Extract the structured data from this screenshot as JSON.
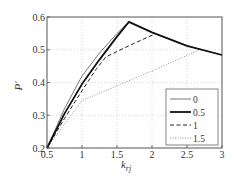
{
  "chart_data": {
    "type": "line",
    "title": "",
    "xlabel": "k_rj",
    "xlabel_main": "k",
    "xlabel_sub": "rj",
    "ylabel": "P′",
    "xlim": [
      0.5,
      3
    ],
    "ylim": [
      0.2,
      0.6
    ],
    "xticks": [
      0.5,
      1,
      1.5,
      2,
      2.5,
      3
    ],
    "xtick_labels": [
      "0.5",
      "1",
      "1.5",
      "2",
      "2.5",
      "3"
    ],
    "yticks": [
      0.2,
      0.3,
      0.4,
      0.5,
      0.6
    ],
    "ytick_labels": [
      "0.2",
      "0.3",
      "0.4",
      "0.5",
      "0.6"
    ],
    "grid": true,
    "legend_position": "lower right",
    "series": [
      {
        "name": "0",
        "style": "solid-thin",
        "color": "#555555",
        "x": [
          0.5,
          0.75,
          1.0,
          1.25,
          1.5,
          1.67,
          2.0,
          2.5,
          3.0
        ],
        "y": [
          0.2,
          0.32,
          0.42,
          0.49,
          0.55,
          0.585,
          0.553,
          0.512,
          0.484
        ]
      },
      {
        "name": "0.5",
        "style": "solid-thick",
        "color": "#111111",
        "x": [
          0.5,
          0.75,
          1.0,
          1.25,
          1.5,
          1.67,
          2.0,
          2.5,
          3.0
        ],
        "y": [
          0.2,
          0.305,
          0.395,
          0.47,
          0.54,
          0.585,
          0.553,
          0.512,
          0.484
        ]
      },
      {
        "name": "1",
        "style": "dashed",
        "color": "#222222",
        "x": [
          0.5,
          0.75,
          1.0,
          1.2,
          1.34,
          1.6,
          1.8,
          2.04
        ],
        "y": [
          0.2,
          0.29,
          0.375,
          0.44,
          0.478,
          0.505,
          0.525,
          0.548
        ]
      },
      {
        "name": "1.5",
        "style": "dotted",
        "color": "#888888",
        "x": [
          0.5,
          1.0,
          1.5,
          2.0,
          2.67
        ],
        "y": [
          0.2,
          0.345,
          0.39,
          0.435,
          0.499
        ]
      }
    ]
  },
  "legend": {
    "items": [
      "0",
      "0.5",
      "1",
      "1.5"
    ]
  }
}
